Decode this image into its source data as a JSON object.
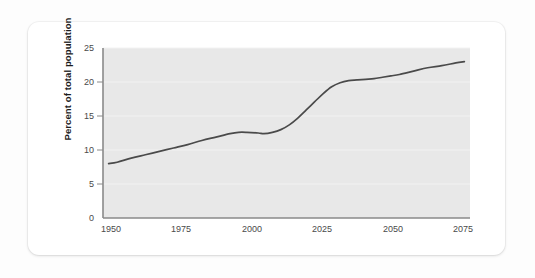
{
  "card": {
    "background_color": "#ffffff"
  },
  "chart_data": {
    "type": "line",
    "title": "Population aged 65 and over",
    "xlabel": "",
    "ylabel": "Percent of total population",
    "xlim": [
      1945,
      2075
    ],
    "ylim": [
      0,
      25
    ],
    "xticks": [
      "1950",
      "1975",
      "2000",
      "2025",
      "2050",
      "2075"
    ],
    "xtick_values": [
      1950,
      1975,
      2000,
      2025,
      2050,
      2075
    ],
    "yticks": [
      "0",
      "5",
      "10",
      "15",
      "20",
      "25"
    ],
    "ytick_values": [
      0,
      5,
      10,
      15,
      20,
      25
    ],
    "grid": true,
    "legend": "none",
    "line_color": "#4a4a4a",
    "plot_background_color": "#e8e8e8",
    "series": [
      {
        "name": "Population aged 65 and over",
        "x": [
          1947,
          1950,
          1955,
          1960,
          1965,
          1970,
          1975,
          1980,
          1985,
          1990,
          1993,
          1996,
          2000,
          2002,
          2005,
          2008,
          2011,
          2014,
          2017,
          2020,
          2023,
          2026,
          2029,
          2032,
          2035,
          2038,
          2041,
          2044,
          2047,
          2050,
          2055,
          2060,
          2065,
          2070,
          2073
        ],
        "values": [
          8.0,
          8.2,
          8.8,
          9.3,
          9.8,
          10.3,
          10.8,
          11.4,
          11.9,
          12.4,
          12.6,
          12.6,
          12.5,
          12.4,
          12.6,
          13.0,
          13.7,
          14.7,
          15.9,
          17.1,
          18.3,
          19.3,
          19.9,
          20.2,
          20.3,
          20.4,
          20.5,
          20.7,
          20.9,
          21.1,
          21.6,
          22.1,
          22.4,
          22.8,
          23.0
        ]
      }
    ]
  }
}
